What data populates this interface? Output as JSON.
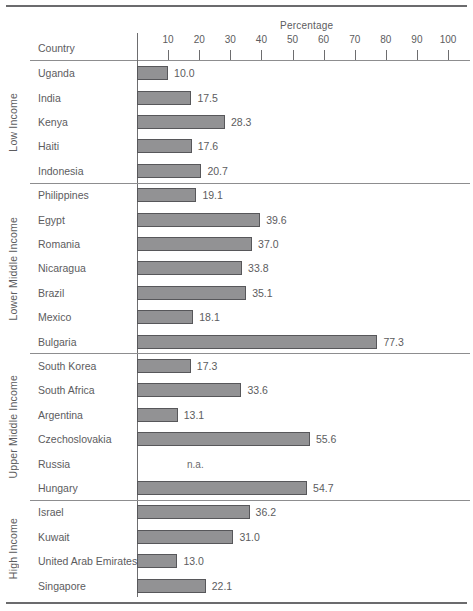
{
  "chart_data": {
    "type": "bar",
    "orientation": "horizontal",
    "title": "",
    "xlabel": "Percentage",
    "ylabel": "Country",
    "xlim": [
      0,
      100
    ],
    "xticks": [
      10,
      20,
      30,
      40,
      50,
      60,
      70,
      80,
      90,
      100
    ],
    "grid": false,
    "legend": "none",
    "categories": [
      "Uganda",
      "India",
      "Kenya",
      "Haiti",
      "Indonesia",
      "Philippines",
      "Egypt",
      "Romania",
      "Nicaragua",
      "Brazil",
      "Mexico",
      "Bulgaria",
      "South Korea",
      "South Africa",
      "Argentina",
      "Czechoslovakia",
      "Russia",
      "Hungary",
      "Israel",
      "Kuwait",
      "United Arab Emirates",
      "Singapore"
    ],
    "values": [
      10.0,
      17.5,
      28.3,
      17.6,
      20.7,
      19.1,
      39.6,
      37.0,
      33.8,
      35.1,
      18.1,
      77.3,
      17.3,
      33.6,
      13.1,
      55.6,
      null,
      54.7,
      36.2,
      31.0,
      13.0,
      22.1
    ],
    "value_labels": [
      "10.0",
      "17.5",
      "28.3",
      "17.6",
      "20.7",
      "19.1",
      "39.6",
      "37.0",
      "33.8",
      "35.1",
      "18.1",
      "77.3",
      "17.3",
      "33.6",
      "13.1",
      "55.6",
      "n.a.",
      "54.7",
      "36.2",
      "31.0",
      "13.0",
      "22.1"
    ],
    "groups": [
      {
        "label": "Low Income",
        "categories": [
          "Uganda",
          "India",
          "Kenya",
          "Haiti",
          "Indonesia"
        ]
      },
      {
        "label": "Lower Middle Income",
        "categories": [
          "Philippines",
          "Egypt",
          "Romania",
          "Nicaragua",
          "Brazil",
          "Mexico",
          "Bulgaria"
        ]
      },
      {
        "label": "Upper Middle Income",
        "categories": [
          "South Korea",
          "South Africa",
          "Argentina",
          "Czechoslovakia",
          "Russia",
          "Hungary"
        ]
      },
      {
        "label": "High Income",
        "categories": [
          "Israel",
          "Kuwait",
          "United Arab Emirates",
          "Singapore"
        ]
      }
    ]
  },
  "axis": {
    "title": "Percentage",
    "country_header": "Country",
    "ticks": [
      "10",
      "20",
      "30",
      "40",
      "50",
      "60",
      "70",
      "80",
      "90",
      "100"
    ]
  },
  "rows": [
    {
      "country": "Uganda",
      "value": 10.0,
      "label": "10.0",
      "group": "Low Income"
    },
    {
      "country": "India",
      "value": 17.5,
      "label": "17.5",
      "group": "Low Income"
    },
    {
      "country": "Kenya",
      "value": 28.3,
      "label": "28.3",
      "group": "Low Income"
    },
    {
      "country": "Haiti",
      "value": 17.6,
      "label": "17.6",
      "group": "Low Income"
    },
    {
      "country": "Indonesia",
      "value": 20.7,
      "label": "20.7",
      "group": "Low Income"
    },
    {
      "country": "Philippines",
      "value": 19.1,
      "label": "19.1",
      "group": "Lower Middle Income"
    },
    {
      "country": "Egypt",
      "value": 39.6,
      "label": "39.6",
      "group": "Lower Middle Income"
    },
    {
      "country": "Romania",
      "value": 37.0,
      "label": "37.0",
      "group": "Lower Middle Income"
    },
    {
      "country": "Nicaragua",
      "value": 33.8,
      "label": "33.8",
      "group": "Lower Middle Income"
    },
    {
      "country": "Brazil",
      "value": 35.1,
      "label": "35.1",
      "group": "Lower Middle Income"
    },
    {
      "country": "Mexico",
      "value": 18.1,
      "label": "18.1",
      "group": "Lower Middle Income"
    },
    {
      "country": "Bulgaria",
      "value": 77.3,
      "label": "77.3",
      "group": "Lower Middle Income"
    },
    {
      "country": "South Korea",
      "value": 17.3,
      "label": "17.3",
      "group": "Upper Middle Income"
    },
    {
      "country": "South Africa",
      "value": 33.6,
      "label": "33.6",
      "group": "Upper Middle Income"
    },
    {
      "country": "Argentina",
      "value": 13.1,
      "label": "13.1",
      "group": "Upper Middle Income"
    },
    {
      "country": "Czechoslovakia",
      "value": 55.6,
      "label": "55.6",
      "group": "Upper Middle Income"
    },
    {
      "country": "Russia",
      "value": null,
      "label": "n.a.",
      "group": "Upper Middle Income"
    },
    {
      "country": "Hungary",
      "value": 54.7,
      "label": "54.7",
      "group": "Upper Middle Income"
    },
    {
      "country": "Israel",
      "value": 36.2,
      "label": "36.2",
      "group": "High Income"
    },
    {
      "country": "Kuwait",
      "value": 31.0,
      "label": "31.0",
      "group": "High Income"
    },
    {
      "country": "United Arab Emirates",
      "value": 13.0,
      "label": "13.0",
      "group": "High Income"
    },
    {
      "country": "Singapore",
      "value": 22.1,
      "label": "22.1",
      "group": "High Income"
    }
  ],
  "groups": [
    "Low Income",
    "Lower Middle Income",
    "Upper Middle Income",
    "High Income"
  ],
  "colors": {
    "bar_fill": "#929294",
    "bar_stroke": "#57575a",
    "text": "#5c5c5e",
    "rule": "#6b6b6d"
  }
}
